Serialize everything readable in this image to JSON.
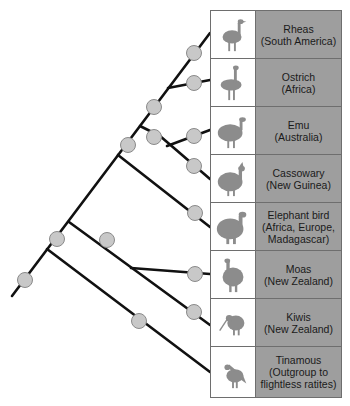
{
  "diagram": {
    "type": "phylogenetic-tree",
    "colors": {
      "branch": "#111111",
      "node": "#c8c8c8",
      "node_stroke": "#8a8a8a",
      "label_bg": "#9e9e9e",
      "silhouette": "#8c8c8c"
    },
    "taxa": [
      {
        "name": "Rheas",
        "region": "(South America)",
        "icon": "rhea-silhouette-icon"
      },
      {
        "name": "Ostrich",
        "region": "(Africa)",
        "icon": "ostrich-silhouette-icon"
      },
      {
        "name": "Emu",
        "region": "(Australia)",
        "icon": "emu-silhouette-icon"
      },
      {
        "name": "Cassowary",
        "region": "(New Guinea)",
        "icon": "cassowary-silhouette-icon"
      },
      {
        "name": "Elephant bird",
        "region": "(Africa, Europe,",
        "region2": "Madagascar)",
        "icon": "elephant-bird-silhouette-icon"
      },
      {
        "name": "Moas",
        "region": "(New Zealand)",
        "icon": "moa-silhouette-icon"
      },
      {
        "name": "Kiwis",
        "region": "(New Zealand)",
        "icon": "kiwi-silhouette-icon"
      },
      {
        "name": "Tinamous",
        "region": "(Outgroup to",
        "region2": "flightless ratites)",
        "icon": "tinamou-silhouette-icon"
      }
    ]
  }
}
